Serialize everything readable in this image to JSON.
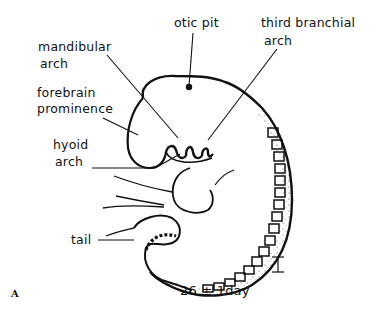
{
  "figure": {
    "panel_label": "A",
    "caption": "26 ± 1day",
    "scale_bar": "scale-bar-icon"
  },
  "labels": {
    "otic_pit": "otic pit",
    "third_branchial_arch_line1": "third branchial",
    "third_branchial_arch_line2": "arch",
    "mandibular_arch_line1": "mandibular",
    "mandibular_arch_line2": "arch",
    "forebrain_prominence_line1": "forebrain",
    "forebrain_prominence_line2": "prominence",
    "hyoid_arch_line1": "hyoid",
    "hyoid_arch_line2": "arch",
    "tail": "tail"
  },
  "colors": {
    "ink": "#111111",
    "background": "#ffffff"
  }
}
